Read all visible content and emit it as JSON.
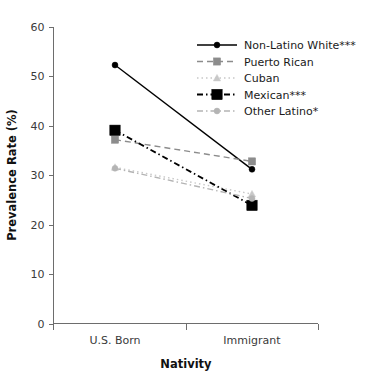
{
  "chart_data": {
    "type": "line",
    "title": "",
    "xlabel": "Nativity",
    "ylabel": "Prevalence Rate (%)",
    "categories": [
      "U.S. Born",
      "Immigrant"
    ],
    "ylim": [
      0,
      60
    ],
    "yticks": [
      0,
      10,
      20,
      30,
      40,
      50,
      60
    ],
    "ytick_labels": [
      "0",
      "10",
      "20",
      "30",
      "40",
      "50",
      "60"
    ],
    "grid": false,
    "legend_position": "top-right",
    "series": [
      {
        "name": "Non-Latino White***",
        "values": [
          52.3,
          31.2
        ],
        "color": "#000000",
        "linestyle": "solid",
        "marker": "circle",
        "marker_size": "small"
      },
      {
        "name": "Puerto Rican",
        "values": [
          37.2,
          32.8
        ],
        "color": "#8c8c8c",
        "linestyle": "dashed",
        "marker": "square",
        "marker_size": "small"
      },
      {
        "name": "Cuban",
        "values": [
          31.6,
          26.2
        ],
        "color": "#c8c8c8",
        "linestyle": "dotted",
        "marker": "triangle",
        "marker_size": "small"
      },
      {
        "name": "Mexican***",
        "values": [
          39.1,
          23.9
        ],
        "color": "#000000",
        "linestyle": "dashdot",
        "marker": "square",
        "marker_size": "large"
      },
      {
        "name": "Other Latino*",
        "values": [
          31.4,
          25.3
        ],
        "color": "#b4b4b4",
        "linestyle": "dashdot",
        "marker": "circle",
        "marker_size": "small"
      }
    ]
  }
}
